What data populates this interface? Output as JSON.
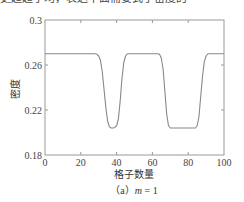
{
  "chart_data": {
    "type": "line",
    "title": "",
    "xlabel": "格子数量",
    "ylabel": "密度",
    "caption": "（a）m = 1",
    "caption_parts": {
      "prefix": "（a）",
      "var": "m",
      "suffix": " = 1"
    },
    "xlim": [
      0,
      100
    ],
    "ylim": [
      0.18,
      0.3
    ],
    "xticks": [
      0,
      20,
      40,
      60,
      80,
      100
    ],
    "xtick_labels": [
      "0",
      "20",
      "40",
      "60",
      "80",
      "100"
    ],
    "yticks": [
      0.18,
      0.22,
      0.26,
      0.3
    ],
    "ytick_labels": [
      "0.18",
      "0.22",
      "0.26",
      "0.3"
    ],
    "grid": false,
    "legend": null,
    "series": [
      {
        "name": "density",
        "color": "#888888",
        "x": [
          0,
          28,
          29,
          30,
          31,
          32,
          33,
          34,
          35,
          36,
          37,
          38,
          39,
          40,
          41,
          42,
          43,
          44,
          45,
          46,
          63,
          64,
          65,
          66,
          67,
          68,
          69,
          70,
          84,
          85,
          86,
          87,
          88,
          89,
          90,
          91,
          100
        ],
        "y": [
          0.27,
          0.27,
          0.2695,
          0.268,
          0.264,
          0.254,
          0.238,
          0.222,
          0.21,
          0.205,
          0.204,
          0.204,
          0.2045,
          0.206,
          0.212,
          0.228,
          0.248,
          0.262,
          0.268,
          0.27,
          0.27,
          0.2695,
          0.266,
          0.256,
          0.236,
          0.216,
          0.206,
          0.204,
          0.204,
          0.206,
          0.214,
          0.232,
          0.25,
          0.263,
          0.268,
          0.27,
          0.27
        ]
      }
    ]
  },
  "page": {
    "top_clipped_text": "更趋趋于均，表达中面需要式于密度的"
  }
}
